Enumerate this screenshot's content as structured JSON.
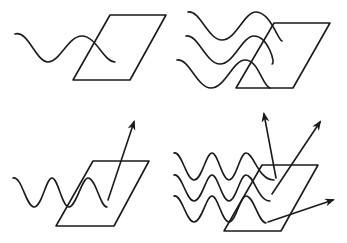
{
  "diagram": {
    "stroke_color": "#1a1a1a",
    "background": "#ffffff",
    "panels": [
      {
        "id": "top-left",
        "waves": 1,
        "arrows": 0
      },
      {
        "id": "top-right",
        "waves": 3,
        "arrows": 0
      },
      {
        "id": "bottom-left",
        "waves": 1,
        "arrows": 1
      },
      {
        "id": "bottom-right",
        "waves": 3,
        "arrows": 3
      }
    ]
  }
}
